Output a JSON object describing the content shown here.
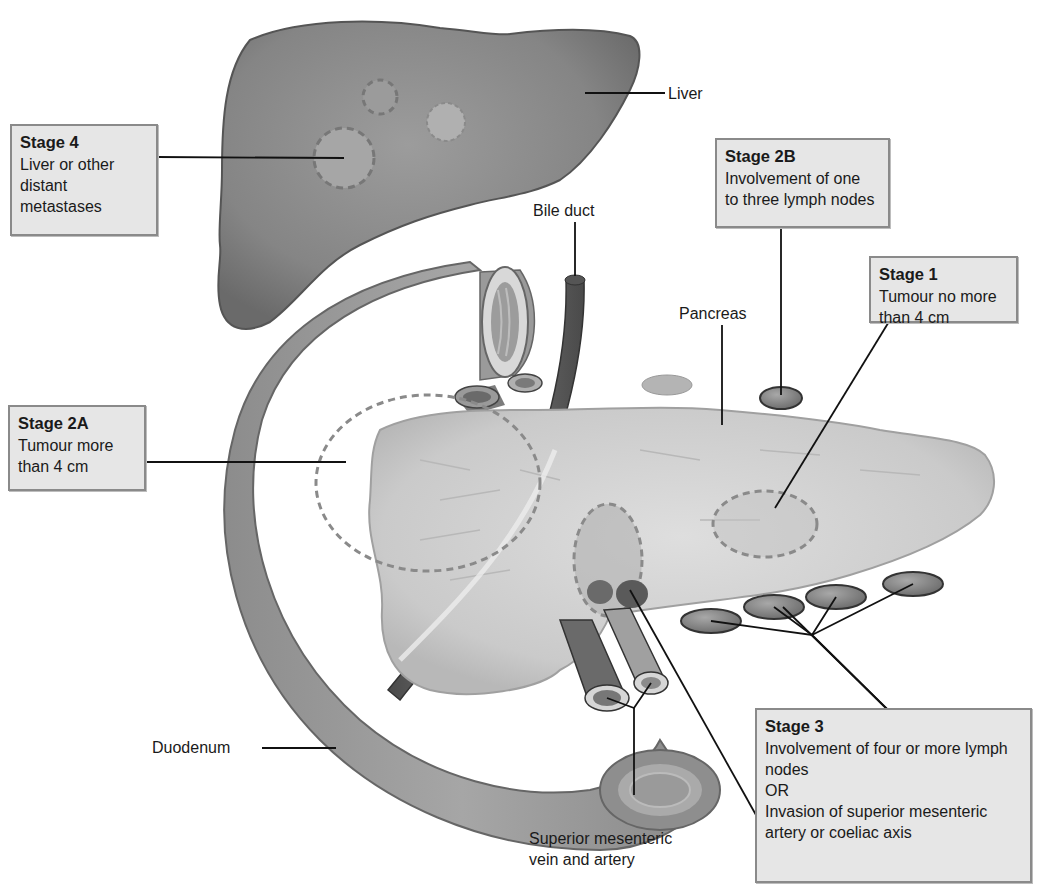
{
  "diagram": {
    "type": "anatomical staging diagram",
    "colors": {
      "organ_dark": "#7a7a7a",
      "organ_mid": "#9a9a9a",
      "pancreas": "#d2d2d2",
      "box_fill": "#e6e6e6",
      "box_border": "#8a8a8a",
      "dashed_outline": "#8c8c8c",
      "leader_line": "#111111"
    }
  },
  "anatomy_labels": {
    "liver": "Liver",
    "bile_duct": "Bile duct",
    "pancreas": "Pancreas",
    "duodenum": "Duodenum",
    "sm_vessels": [
      "Superior mesenteric",
      "vein and artery"
    ]
  },
  "stages": {
    "stage4": {
      "title": "Stage 4",
      "lines": [
        "Liver or other",
        "distant",
        "metastases"
      ]
    },
    "stage2b": {
      "title": "Stage 2B",
      "lines": [
        "Involvement of one",
        "to three lymph nodes"
      ]
    },
    "stage1": {
      "title": "Stage 1",
      "lines": [
        "Tumour no more",
        "than 4 cm"
      ]
    },
    "stage2a": {
      "title": "Stage 2A",
      "lines": [
        "Tumour more",
        "than 4 cm"
      ]
    },
    "stage3": {
      "title": "Stage 3",
      "lines": [
        "Involvement of four or more lymph",
        "nodes",
        "OR",
        "Invasion of superior mesenteric",
        "artery or coeliac axis"
      ]
    }
  }
}
